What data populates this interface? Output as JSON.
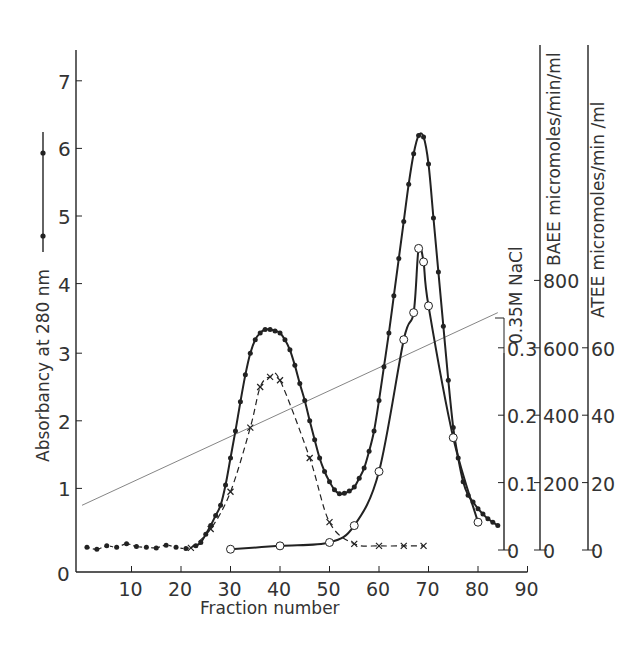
{
  "chart_data": {
    "type": "line",
    "title": "",
    "xlabel": "Fraction number",
    "ylabel": "Absorbancy at 280 nm",
    "xlim": [
      0,
      90
    ],
    "ylim": [
      0,
      7.5
    ],
    "x_ticks": [
      0,
      10,
      20,
      30,
      40,
      50,
      60,
      70,
      80,
      90
    ],
    "y_ticks": [
      0,
      1,
      2,
      3,
      4,
      5,
      6,
      7
    ],
    "right_axes": [
      {
        "label": "0.35M NaCl",
        "ticks": [
          0,
          0.1,
          0.2,
          0.3
        ],
        "range": [
          0,
          0.35
        ]
      },
      {
        "label": "BAEE micromoles/min/ml",
        "ticks": [
          0,
          200,
          400,
          600,
          800
        ]
      },
      {
        "label": "ATEE micromoles/min /ml",
        "ticks": [
          0,
          20,
          40,
          60
        ]
      }
    ],
    "legend": {
      "symbol": "-•-•-",
      "description": "Absorbancy at 280 nm (solid line with filled dots)"
    },
    "grid": false,
    "series": [
      {
        "name": "Absorbancy at 280 nm",
        "style": "solid-filled-dots",
        "x": [
          1,
          3,
          5,
          7,
          9,
          11,
          13,
          15,
          17,
          19,
          21,
          23,
          24,
          25,
          26,
          27,
          28,
          29,
          30,
          31,
          32,
          33,
          34,
          35,
          36,
          37,
          38,
          39,
          40,
          41,
          42,
          43,
          44,
          45,
          46,
          47,
          48,
          49,
          50,
          51,
          52,
          53,
          54,
          55,
          56,
          57,
          58,
          59,
          60,
          61,
          62,
          63,
          64,
          65,
          66,
          67,
          68,
          69,
          70,
          71,
          72,
          73,
          74,
          75,
          76,
          77,
          78,
          79,
          80,
          81,
          82,
          83,
          84
        ],
        "values": [
          0.13,
          0.1,
          0.15,
          0.13,
          0.18,
          0.14,
          0.13,
          0.12,
          0.16,
          0.13,
          0.11,
          0.15,
          0.2,
          0.32,
          0.45,
          0.6,
          0.75,
          1.05,
          1.45,
          1.85,
          2.28,
          2.68,
          3.0,
          3.2,
          3.3,
          3.35,
          3.35,
          3.33,
          3.3,
          3.2,
          3.05,
          2.82,
          2.55,
          2.3,
          2.0,
          1.72,
          1.45,
          1.25,
          1.1,
          0.98,
          0.92,
          0.93,
          0.96,
          1.02,
          1.15,
          1.3,
          1.55,
          1.85,
          2.3,
          2.8,
          3.3,
          3.85,
          4.4,
          4.95,
          5.5,
          5.95,
          6.22,
          6.2,
          5.8,
          5.0,
          4.2,
          3.4,
          2.6,
          1.9,
          1.45,
          1.1,
          0.9,
          0.8,
          0.7,
          0.62,
          0.55,
          0.5,
          0.45
        ]
      },
      {
        "name": "0.35M NaCl gradient",
        "style": "thin-line",
        "x": [
          0,
          84
        ],
        "values": [
          0.75,
          3.6
        ],
        "nacl_values": [
          0.02,
          0.35
        ]
      },
      {
        "name": "BAEE activity",
        "style": "solid-open-circles",
        "x": [
          30,
          40,
          50,
          55,
          60,
          65,
          67,
          68,
          69,
          70,
          75,
          80
        ],
        "values": [
          0.1,
          0.15,
          0.2,
          0.45,
          1.25,
          3.2,
          3.6,
          4.55,
          4.35,
          3.7,
          1.75,
          0.5
        ]
      },
      {
        "name": "ATEE activity",
        "style": "dashed-crosses",
        "x": [
          22,
          26,
          30,
          34,
          36,
          38,
          40,
          46,
          50,
          55,
          60,
          65,
          69
        ],
        "values": [
          0.12,
          0.4,
          0.95,
          1.9,
          2.5,
          2.65,
          2.6,
          1.45,
          0.5,
          0.18,
          0.15,
          0.15,
          0.15
        ]
      }
    ]
  },
  "labels": {
    "xlabel": "Fraction number",
    "ylabel": "Absorbancy at 280 nm",
    "nacl": "0.35M NaCl",
    "baee": "BAEE micromoles/min/ml",
    "atee": "ATEE micromoles/min /ml"
  }
}
